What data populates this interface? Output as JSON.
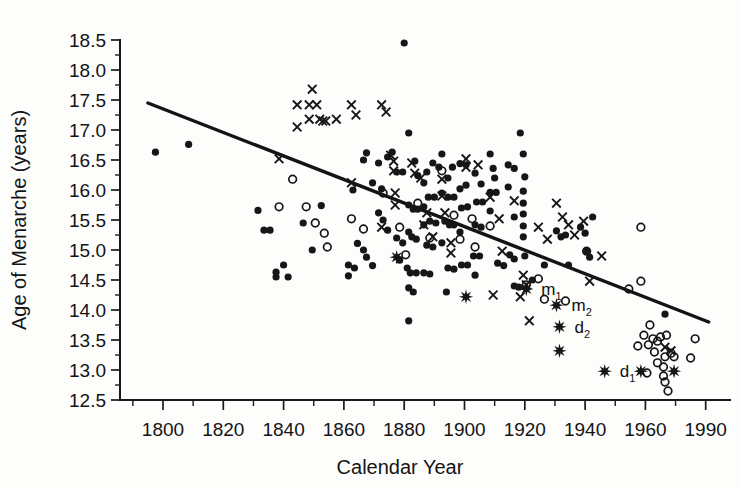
{
  "chart_data": {
    "type": "scatter",
    "title": "",
    "xlabel": "Calendar Year",
    "ylabel": "Age of Menarche (years)",
    "xlim": [
      1790,
      1995
    ],
    "ylim": [
      12.5,
      18.5
    ],
    "xticks": [
      1800,
      1820,
      1840,
      1860,
      1880,
      1900,
      1920,
      1940,
      1960,
      1990
    ],
    "yticks": [
      "12.5",
      "13.0",
      "13.5",
      "14.0",
      "14.5",
      "15.0",
      "15.5",
      "16.0",
      "16.5",
      "17.0",
      "17.5",
      "18.0",
      "18.5"
    ],
    "grid": false,
    "legend": null,
    "minor_ticks": true,
    "trendline": {
      "name": "regression-line",
      "x0": 1795,
      "y0": 17.45,
      "x1": 1981,
      "y1": 13.8
    },
    "series": [
      {
        "name": "filled-circle",
        "marker": "filled-circle",
        "points": [
          [
            1797.5,
            16.63
          ],
          [
            1808.5,
            16.76
          ],
          [
            1831.5,
            15.66
          ],
          [
            1833.5,
            15.33
          ],
          [
            1835.5,
            15.33
          ],
          [
            1837.5,
            14.63
          ],
          [
            1837.5,
            14.55
          ],
          [
            1840.0,
            14.75
          ],
          [
            1841.5,
            14.55
          ],
          [
            1846.5,
            15.45
          ],
          [
            1849.5,
            15.0
          ],
          [
            1852.5,
            15.74
          ],
          [
            1861.5,
            14.75
          ],
          [
            1861.5,
            14.57
          ],
          [
            1863.5,
            14.7
          ],
          [
            1864.5,
            15.11
          ],
          [
            1863.0,
            16.0
          ],
          [
            1866.5,
            16.5
          ],
          [
            1867.5,
            16.62
          ],
          [
            1869.5,
            16.12
          ],
          [
            1866.5,
            15.0
          ],
          [
            1867.5,
            14.88
          ],
          [
            1869.5,
            14.74
          ],
          [
            1871.5,
            16.45
          ],
          [
            1872.5,
            16.02
          ],
          [
            1874.5,
            16.55
          ],
          [
            1876.0,
            16.63
          ],
          [
            1871.5,
            15.62
          ],
          [
            1873.0,
            15.5
          ],
          [
            1874.5,
            15.33
          ],
          [
            1877.5,
            16.3
          ],
          [
            1879.5,
            16.3
          ],
          [
            1880.0,
            18.45
          ],
          [
            1877.5,
            15.2
          ],
          [
            1879.5,
            15.12
          ],
          [
            1878.5,
            14.83
          ],
          [
            1881.5,
            16.95
          ],
          [
            1883.5,
            16.48
          ],
          [
            1884.5,
            16.24
          ],
          [
            1881.5,
            15.75
          ],
          [
            1883.0,
            15.68
          ],
          [
            1884.5,
            15.68
          ],
          [
            1881.5,
            15.3
          ],
          [
            1882.5,
            15.22
          ],
          [
            1884.0,
            15.18
          ],
          [
            1881.0,
            14.7
          ],
          [
            1882.0,
            14.62
          ],
          [
            1884.0,
            14.62
          ],
          [
            1881.5,
            14.37
          ],
          [
            1883.0,
            14.3
          ],
          [
            1881.5,
            13.82
          ],
          [
            1886.5,
            16.12
          ],
          [
            1887.5,
            16.3
          ],
          [
            1889.5,
            16.45
          ],
          [
            1891.5,
            16.38
          ],
          [
            1886.5,
            15.72
          ],
          [
            1888.0,
            15.88
          ],
          [
            1890.0,
            15.88
          ],
          [
            1886.5,
            15.42
          ],
          [
            1888.5,
            15.48
          ],
          [
            1890.5,
            15.45
          ],
          [
            1887.5,
            15.08
          ],
          [
            1889.5,
            15.05
          ],
          [
            1886.5,
            14.62
          ],
          [
            1888.5,
            14.6
          ],
          [
            1892.5,
            16.6
          ],
          [
            1894.5,
            16.2
          ],
          [
            1896.0,
            16.38
          ],
          [
            1892.5,
            15.95
          ],
          [
            1894.5,
            15.88
          ],
          [
            1896.5,
            15.88
          ],
          [
            1893.5,
            15.48
          ],
          [
            1895.0,
            15.42
          ],
          [
            1896.5,
            15.42
          ],
          [
            1892.5,
            15.12
          ],
          [
            1894.5,
            14.7
          ],
          [
            1896.5,
            14.68
          ],
          [
            1894.0,
            14.3
          ],
          [
            1898.5,
            16.44
          ],
          [
            1900.5,
            16.42
          ],
          [
            1898.5,
            16.02
          ],
          [
            1900.5,
            16.08
          ],
          [
            1899.0,
            15.7
          ],
          [
            1901.0,
            15.72
          ],
          [
            1898.5,
            15.3
          ],
          [
            1899.0,
            14.75
          ],
          [
            1901.0,
            14.75
          ],
          [
            1903.5,
            16.28
          ],
          [
            1905.5,
            16.1
          ],
          [
            1904.0,
            15.8
          ],
          [
            1906.0,
            15.8
          ],
          [
            1903.5,
            15.42
          ],
          [
            1905.5,
            15.38
          ],
          [
            1903.0,
            14.9
          ],
          [
            1905.0,
            14.9
          ],
          [
            1903.5,
            14.58
          ],
          [
            1908.5,
            16.6
          ],
          [
            1909.5,
            16.36
          ],
          [
            1910.0,
            16.2
          ],
          [
            1908.5,
            15.96
          ],
          [
            1910.5,
            15.96
          ],
          [
            1908.5,
            15.65
          ],
          [
            1911.0,
            14.78
          ],
          [
            1913.0,
            14.74
          ],
          [
            1914.5,
            16.42
          ],
          [
            1916.5,
            16.36
          ],
          [
            1914.5,
            16.05
          ],
          [
            1916.5,
            15.55
          ],
          [
            1915.0,
            14.92
          ],
          [
            1916.5,
            14.85
          ],
          [
            1916.5,
            14.4
          ],
          [
            1918.0,
            14.38
          ],
          [
            1918.5,
            16.95
          ],
          [
            1919.5,
            16.6
          ],
          [
            1920.0,
            16.22
          ],
          [
            1919.5,
            15.98
          ],
          [
            1919.5,
            15.78
          ],
          [
            1919.5,
            15.6
          ],
          [
            1919.5,
            15.4
          ],
          [
            1919.5,
            15.22
          ],
          [
            1920.0,
            14.9
          ],
          [
            1922.5,
            14.5
          ],
          [
            1926.5,
            14.75
          ],
          [
            1930.5,
            15.32
          ],
          [
            1932.0,
            15.22
          ],
          [
            1933.5,
            15.25
          ],
          [
            1934.5,
            14.75
          ],
          [
            1938.5,
            15.38
          ],
          [
            1940.0,
            15.28
          ],
          [
            1940.5,
            14.98
          ],
          [
            1941.5,
            14.88
          ],
          [
            1942.5,
            15.55
          ],
          [
            1966.5,
            13.93
          ]
        ]
      },
      {
        "name": "open-circle",
        "marker": "open-circle",
        "points": [
          [
            1838.5,
            15.72
          ],
          [
            1843.0,
            16.18
          ],
          [
            1847.5,
            15.72
          ],
          [
            1850.5,
            15.45
          ],
          [
            1853.5,
            15.28
          ],
          [
            1854.5,
            15.05
          ],
          [
            1862.5,
            15.52
          ],
          [
            1866.5,
            15.35
          ],
          [
            1873.0,
            15.95
          ],
          [
            1878.5,
            15.38
          ],
          [
            1880.5,
            14.92
          ],
          [
            1884.5,
            15.78
          ],
          [
            1888.5,
            15.2
          ],
          [
            1892.5,
            16.32
          ],
          [
            1896.5,
            15.58
          ],
          [
            1898.5,
            15.18
          ],
          [
            1902.5,
            15.52
          ],
          [
            1903.5,
            15.05
          ],
          [
            1908.5,
            15.4
          ],
          [
            1920.5,
            14.42
          ],
          [
            1924.5,
            14.52
          ],
          [
            1926.5,
            14.18
          ],
          [
            1933.5,
            14.15
          ],
          [
            1940.5,
            14.98
          ],
          [
            1954.5,
            14.35
          ],
          [
            1958.5,
            14.48
          ],
          [
            1958.5,
            15.38
          ],
          [
            1961.5,
            13.75
          ],
          [
            1959.5,
            13.58
          ],
          [
            1962.5,
            13.52
          ],
          [
            1965.0,
            13.55
          ],
          [
            1967.0,
            13.58
          ],
          [
            1957.5,
            13.4
          ],
          [
            1961.0,
            13.42
          ],
          [
            1964.0,
            13.48
          ],
          [
            1963.0,
            13.3
          ],
          [
            1966.5,
            13.22
          ],
          [
            1968.5,
            13.28
          ],
          [
            1964.0,
            13.12
          ],
          [
            1966.0,
            13.05
          ],
          [
            1969.5,
            13.22
          ],
          [
            1960.5,
            12.95
          ],
          [
            1966.0,
            12.9
          ],
          [
            1966.5,
            12.8
          ],
          [
            1967.5,
            12.65
          ],
          [
            1976.5,
            13.52
          ],
          [
            1975.0,
            13.2
          ]
        ]
      },
      {
        "name": "cross",
        "marker": "cross",
        "points": [
          [
            1838.5,
            16.52
          ],
          [
            1844.5,
            17.42
          ],
          [
            1844.5,
            17.05
          ],
          [
            1849.5,
            17.68
          ],
          [
            1848.5,
            17.42
          ],
          [
            1851.0,
            17.42
          ],
          [
            1848.5,
            17.18
          ],
          [
            1852.0,
            17.18
          ],
          [
            1853.0,
            17.15
          ],
          [
            1854.0,
            17.15
          ],
          [
            1857.5,
            17.18
          ],
          [
            1862.5,
            17.42
          ],
          [
            1864.0,
            17.25
          ],
          [
            1872.5,
            17.42
          ],
          [
            1874.0,
            17.3
          ],
          [
            1862.5,
            16.12
          ],
          [
            1875.5,
            16.58
          ],
          [
            1876.5,
            16.48
          ],
          [
            1876.5,
            16.32
          ],
          [
            1877.0,
            15.95
          ],
          [
            1877.0,
            15.75
          ],
          [
            1882.5,
            16.45
          ],
          [
            1883.5,
            16.28
          ],
          [
            1885.5,
            16.2
          ],
          [
            1872.5,
            15.38
          ],
          [
            1892.5,
            16.18
          ],
          [
            1892.5,
            15.9
          ],
          [
            1887.5,
            15.62
          ],
          [
            1893.5,
            15.62
          ],
          [
            1886.5,
            15.42
          ],
          [
            1889.5,
            15.22
          ],
          [
            1895.5,
            15.12
          ],
          [
            1895.5,
            14.95
          ],
          [
            1900.5,
            16.52
          ],
          [
            1900.5,
            16.38
          ],
          [
            1904.5,
            16.42
          ],
          [
            1908.5,
            15.88
          ],
          [
            1911.5,
            15.52
          ],
          [
            1912.5,
            14.98
          ],
          [
            1909.5,
            14.25
          ],
          [
            1916.5,
            15.82
          ],
          [
            1919.5,
            14.58
          ],
          [
            1920.5,
            14.42
          ],
          [
            1918.5,
            14.22
          ],
          [
            1921.5,
            13.82
          ],
          [
            1924.5,
            15.38
          ],
          [
            1927.5,
            15.18
          ],
          [
            1930.5,
            15.78
          ],
          [
            1932.5,
            15.55
          ],
          [
            1934.5,
            15.42
          ],
          [
            1936.5,
            15.25
          ],
          [
            1939.5,
            15.48
          ],
          [
            1945.5,
            14.9
          ],
          [
            1941.5,
            14.48
          ],
          [
            1966.5,
            13.38
          ],
          [
            1968.5,
            13.32
          ]
        ]
      },
      {
        "name": "star",
        "marker": "star",
        "points": [
          [
            1877.5,
            14.88
          ],
          [
            1900.5,
            14.22
          ],
          [
            1920.5,
            14.35
          ],
          [
            1930.5,
            14.08
          ],
          [
            1931.5,
            13.72
          ],
          [
            1931.5,
            13.32
          ],
          [
            1946.5,
            12.98
          ],
          [
            1958.5,
            12.98
          ],
          [
            1969.5,
            12.98
          ]
        ]
      }
    ],
    "point_labels": [
      {
        "id": "m1",
        "text": "m",
        "sub": "1",
        "x": 1922.5,
        "y": 14.35
      },
      {
        "id": "m2",
        "text": "m",
        "sub": "2",
        "x": 1932.5,
        "y": 14.08
      },
      {
        "id": "d2",
        "text": "d",
        "sub": "2",
        "x": 1933.5,
        "y": 13.72
      },
      {
        "id": "d1",
        "text": "d",
        "sub": "1",
        "x": 1948.5,
        "y": 12.98
      }
    ]
  }
}
